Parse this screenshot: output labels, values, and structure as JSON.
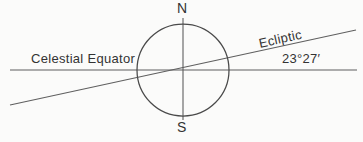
{
  "diagram": {
    "type": "celestial-sphere-obliquity-diagram",
    "labels": {
      "north_pole": "N",
      "south_pole": "S",
      "celestial_equator": "Celestial Equator",
      "ecliptic": "Ecliptic",
      "obliquity_angle": "23°27′"
    },
    "geometry": {
      "ecliptic_tilt_degrees": 12.2,
      "circle_center": "183,70",
      "circle_radius": 46
    },
    "colors": {
      "background": "#fbfbfa",
      "line": "#5f5f5f",
      "circle": "#4a4a4a",
      "text": "#333333"
    }
  }
}
